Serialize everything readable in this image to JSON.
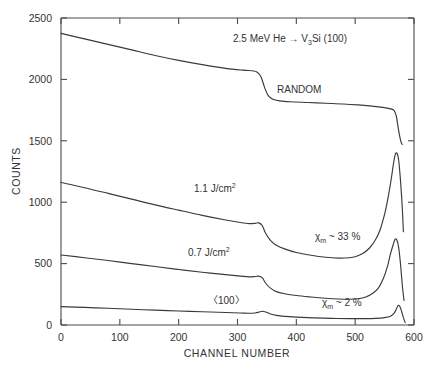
{
  "figure": {
    "title": "2.5 MeV He → V3Si (100)",
    "title_parts": {
      "pre": "2.5 MeV He ",
      "arrow": "→",
      "species_main": " V",
      "species_sub": "3",
      "species_tail": "Si  (100)"
    },
    "background_color": "#ffffff",
    "line_color": "#3a3a3a",
    "axis_color": "#4a4a4a"
  },
  "chart_data": {
    "type": "line",
    "title": "2.5 MeV He → V3Si (100)",
    "xlabel": "CHANNEL NUMBER",
    "ylabel": "COUNTS",
    "xlim": [
      0,
      600
    ],
    "ylim": [
      0,
      2500
    ],
    "xticks": [
      0,
      100,
      200,
      300,
      400,
      500,
      600
    ],
    "yticks": [
      0,
      500,
      1000,
      1500,
      2000,
      2500
    ],
    "xticklabels": [
      "0",
      "100",
      "200",
      "300",
      "400",
      "500",
      "600"
    ],
    "yticklabels": [
      "0",
      "500",
      "1000",
      "1500",
      "2000",
      "2500"
    ],
    "grid": false,
    "legend_position": "inline-annotations",
    "series": [
      {
        "name": "RANDOM",
        "label": "RANDOM",
        "label_x": 370,
        "label_y": 1880,
        "x": [
          0,
          40,
          80,
          120,
          160,
          200,
          240,
          280,
          310,
          325,
          333,
          340,
          346,
          352,
          360,
          372,
          390,
          420,
          450,
          480,
          505,
          525,
          540,
          552,
          560,
          566,
          570,
          573,
          576,
          578,
          580
        ],
        "y": [
          2375,
          2330,
          2285,
          2240,
          2195,
          2155,
          2120,
          2090,
          2075,
          2070,
          2060,
          2020,
          1935,
          1870,
          1838,
          1825,
          1818,
          1812,
          1806,
          1800,
          1792,
          1784,
          1776,
          1768,
          1760,
          1748,
          1700,
          1610,
          1530,
          1490,
          1470
        ]
      },
      {
        "name": "1.1 J/cm2",
        "label": "1.1 J/cm",
        "label_sup": "2",
        "label_x": 225,
        "label_y": 1040,
        "chi_label": "χm ~ 33 %",
        "chi_x": 425,
        "chi_y": 690,
        "x": [
          0,
          40,
          80,
          120,
          160,
          200,
          240,
          280,
          305,
          320,
          330,
          336,
          342,
          348,
          356,
          366,
          380,
          400,
          425,
          450,
          472,
          490,
          500,
          512,
          524,
          534,
          542,
          550,
          556,
          561,
          565,
          568,
          571,
          574,
          577,
          580,
          582
        ],
        "y": [
          1160,
          1118,
          1072,
          1025,
          978,
          935,
          893,
          855,
          835,
          826,
          828,
          832,
          810,
          745,
          690,
          650,
          620,
          590,
          568,
          552,
          545,
          548,
          556,
          580,
          625,
          690,
          770,
          900,
          1040,
          1180,
          1310,
          1385,
          1400,
          1340,
          1180,
          960,
          760
        ]
      },
      {
        "name": "0.7 J/cm2",
        "label": "0.7 J/cm",
        "label_sup": "2",
        "label_x": 215,
        "label_y": 520,
        "chi_label": "χm ~ 2 %",
        "chi_x": 425,
        "chi_y": 160,
        "x": [
          0,
          40,
          80,
          120,
          160,
          200,
          240,
          280,
          305,
          320,
          330,
          336,
          342,
          348,
          356,
          366,
          380,
          400,
          425,
          450,
          472,
          490,
          505,
          518,
          530,
          540,
          548,
          555,
          560,
          565,
          568,
          571,
          574,
          577,
          580,
          583
        ],
        "y": [
          570,
          548,
          525,
          500,
          476,
          452,
          430,
          410,
          398,
          392,
          395,
          398,
          385,
          340,
          300,
          272,
          255,
          240,
          228,
          218,
          212,
          210,
          214,
          228,
          258,
          305,
          380,
          480,
          580,
          660,
          700,
          690,
          630,
          500,
          330,
          200
        ]
      },
      {
        "name": "<100>",
        "label": "〈100〉",
        "label_x": 250,
        "label_y": 105,
        "x": [
          0,
          40,
          80,
          120,
          160,
          200,
          240,
          280,
          305,
          320,
          330,
          336,
          342,
          348,
          356,
          366,
          380,
          400,
          430,
          460,
          490,
          515,
          535,
          550,
          560,
          566,
          570,
          573,
          576,
          579,
          582,
          585
        ],
        "y": [
          150,
          143,
          136,
          128,
          121,
          114,
          108,
          102,
          98,
          96,
          98,
          104,
          112,
          106,
          90,
          78,
          70,
          64,
          58,
          54,
          52,
          52,
          54,
          60,
          72,
          95,
          130,
          160,
          150,
          110,
          60,
          20
        ]
      }
    ],
    "annotations": [
      {
        "text": "RANDOM",
        "x": 370,
        "y": 1880
      },
      {
        "text": "1.1 J/cm2",
        "x": 225,
        "y": 1040
      },
      {
        "text": "0.7 J/cm2",
        "x": 215,
        "y": 520
      },
      {
        "text": "〈100〉",
        "x": 250,
        "y": 105
      },
      {
        "text": "χm ~ 33 %",
        "x": 425,
        "y": 690
      },
      {
        "text": "χm ~ 2 %",
        "x": 425,
        "y": 160
      },
      {
        "text": "2.5 MeV He → V3Si (100)",
        "x": 355,
        "y": 2350
      }
    ]
  }
}
